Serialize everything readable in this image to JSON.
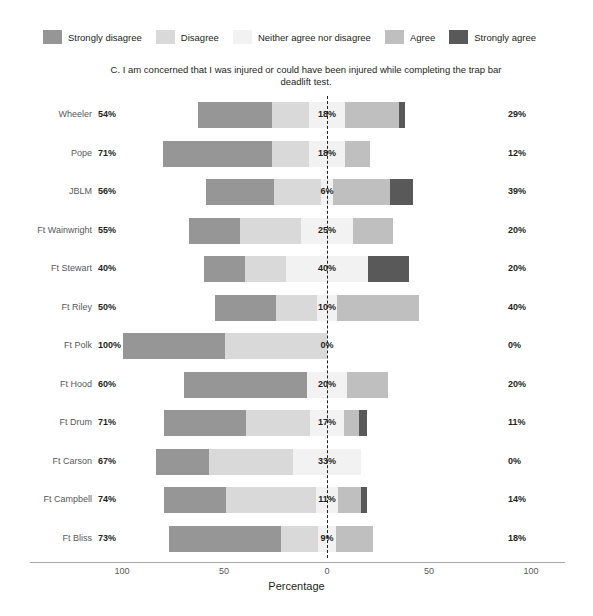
{
  "chart_data": {
    "type": "bar",
    "subtype": "diverging-stacked-likert",
    "title": "C. I am concerned that I was injured or could have been injured while completing the trap bar deadlift test.",
    "xlabel": "Percentage",
    "ylabel": "",
    "xlim": [
      -100,
      100
    ],
    "xticks": [
      {
        "label": "100",
        "value": -100,
        "x": 122
      },
      {
        "label": "50",
        "value": -50,
        "x": 224
      },
      {
        "label": "0",
        "value": 0,
        "x": 327
      },
      {
        "label": "50",
        "value": 50,
        "x": 429
      },
      {
        "label": "100",
        "value": 100,
        "x": 531
      }
    ],
    "grid": false,
    "legend_position": "top",
    "legend": [
      {
        "label": "Strongly disagree",
        "color": "#969696"
      },
      {
        "label": "Disagree",
        "color": "#d9d9d9"
      },
      {
        "label": "Neither agree nor disagree",
        "color": "#f2f2f2"
      },
      {
        "label": "Agree",
        "color": "#bfbfbf"
      },
      {
        "label": "Strongly agree",
        "color": "#595959"
      }
    ],
    "series_names": [
      "Strongly disagree",
      "Disagree",
      "Neither agree nor disagree",
      "Agree",
      "Strongly agree"
    ],
    "categories": [
      "Wheeler",
      "Pope",
      "JBLM",
      "Ft Wainwright",
      "Ft Stewart",
      "Ft Riley",
      "Ft Polk",
      "Ft Hood",
      "Ft Drum",
      "Ft Carson",
      "Ft Campbell",
      "Ft Bliss"
    ],
    "rows": [
      {
        "category": "Wheeler",
        "disagree_total_label": "54%",
        "neither_label": "18%",
        "agree_total_label": "29%",
        "values": {
          "strongly_disagree": 36,
          "disagree": 18,
          "neither": 18,
          "agree": 26,
          "strongly_agree": 3
        }
      },
      {
        "category": "Pope",
        "disagree_total_label": "71%",
        "neither_label": "18%",
        "agree_total_label": "12%",
        "values": {
          "strongly_disagree": 53,
          "disagree": 18,
          "neither": 18,
          "agree": 12,
          "strongly_agree": 0
        }
      },
      {
        "category": "JBLM",
        "disagree_total_label": "56%",
        "neither_label": "6%",
        "agree_total_label": "39%",
        "values": {
          "strongly_disagree": 33,
          "disagree": 23,
          "neither": 6,
          "agree": 28,
          "strongly_agree": 11
        }
      },
      {
        "category": "Ft Wainwright",
        "disagree_total_label": "55%",
        "neither_label": "25%",
        "agree_total_label": "20%",
        "values": {
          "strongly_disagree": 25,
          "disagree": 30,
          "neither": 25,
          "agree": 20,
          "strongly_agree": 0
        }
      },
      {
        "category": "Ft Stewart",
        "disagree_total_label": "40%",
        "neither_label": "40%",
        "agree_total_label": "20%",
        "values": {
          "strongly_disagree": 20,
          "disagree": 20,
          "neither": 40,
          "agree": 0,
          "strongly_agree": 20
        }
      },
      {
        "category": "Ft Riley",
        "disagree_total_label": "50%",
        "neither_label": "10%",
        "agree_total_label": "40%",
        "values": {
          "strongly_disagree": 30,
          "disagree": 20,
          "neither": 10,
          "agree": 40,
          "strongly_agree": 0
        }
      },
      {
        "category": "Ft Polk",
        "disagree_total_label": "100%",
        "neither_label": "0%",
        "agree_total_label": "0%",
        "values": {
          "strongly_disagree": 50,
          "disagree": 50,
          "neither": 0,
          "agree": 0,
          "strongly_agree": 0
        }
      },
      {
        "category": "Ft Hood",
        "disagree_total_label": "60%",
        "neither_label": "20%",
        "agree_total_label": "20%",
        "values": {
          "strongly_disagree": 60,
          "disagree": 0,
          "neither": 20,
          "agree": 20,
          "strongly_agree": 0
        }
      },
      {
        "category": "Ft Drum",
        "disagree_total_label": "71%",
        "neither_label": "17%",
        "agree_total_label": "11%",
        "values": {
          "strongly_disagree": 40,
          "disagree": 31,
          "neither": 17,
          "agree": 7,
          "strongly_agree": 4
        }
      },
      {
        "category": "Ft Carson",
        "disagree_total_label": "67%",
        "neither_label": "33%",
        "agree_total_label": "0%",
        "values": {
          "strongly_disagree": 26,
          "disagree": 41,
          "neither": 33,
          "agree": 0,
          "strongly_agree": 0
        }
      },
      {
        "category": "Ft Campbell",
        "disagree_total_label": "74%",
        "neither_label": "11%",
        "agree_total_label": "14%",
        "values": {
          "strongly_disagree": 30,
          "disagree": 44,
          "neither": 11,
          "agree": 11,
          "strongly_agree": 3
        }
      },
      {
        "category": "Ft Bliss",
        "disagree_total_label": "73%",
        "neither_label": "9%",
        "agree_total_label": "18%",
        "values": {
          "strongly_disagree": 55,
          "disagree": 18,
          "neither": 9,
          "agree": 18,
          "strongly_agree": 0
        }
      }
    ]
  }
}
